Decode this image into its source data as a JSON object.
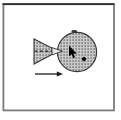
{
  "palette": {
    "page_bg": "#ffffff",
    "frame_border": "#7b7b7b",
    "frame_top": "#2f2f2f",
    "halftone_base": "#c9c9c9",
    "halftone_dot": "#5e5e5e",
    "shape_outline": "#3a3a3a",
    "line_color": "#1c1c1c",
    "cursor_color": "#000000",
    "handle_color": "#000000",
    "arrowhead_light_fill": "#e6e6e6",
    "arrowhead_light_stroke": "#333333",
    "top_marker_color": "#3a3a3a"
  },
  "icons": {
    "sphere": "halftone-sphere-shape",
    "cone": "halftone-cone-shape",
    "axis": "dashed-centerline",
    "tip_arrow": "inward-arrowhead",
    "cursor": "mouse-arrow-cursor",
    "handle": "selection-handle-diamond",
    "top_marker": "top-edge-dot",
    "drag_arrow": "rightward-motion-arrow"
  }
}
